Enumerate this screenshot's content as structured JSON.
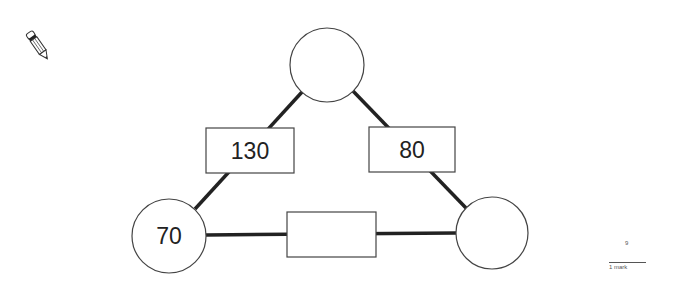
{
  "question": {
    "number": "9",
    "marks_label": "1 mark"
  },
  "icons": {
    "pencil": "pencil-icon"
  },
  "diagram": {
    "type": "addition-triangle",
    "circles": {
      "top": "",
      "left": "70",
      "right": ""
    },
    "boxes": {
      "left_side": "130",
      "right_side": "80",
      "bottom": ""
    }
  }
}
